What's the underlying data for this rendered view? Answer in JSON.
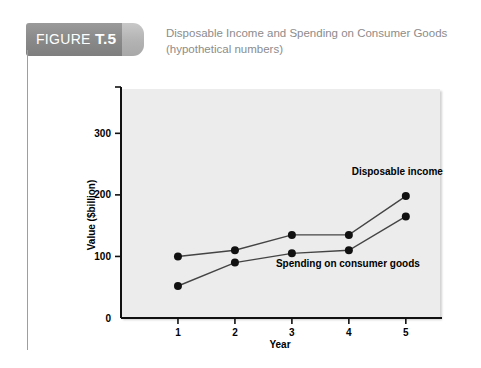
{
  "figure": {
    "label_prefix": "FIGURE ",
    "label_number": "T.5",
    "caption_line1": "Disposable Income and Spending on Consumer Goods",
    "caption_line2": "(hypothetical numbers)",
    "banner_color": "#8b8b8b",
    "caption_color": "#8c8c8c"
  },
  "chart_data": {
    "type": "line",
    "title": "Disposable Income and Spending on Consumer Goods (hypothetical numbers)",
    "xlabel": "Year",
    "ylabel": "Value ($billion)",
    "categories": [
      "1",
      "2",
      "3",
      "4",
      "5"
    ],
    "x": [
      1,
      2,
      3,
      4,
      5
    ],
    "xlim": [
      0,
      5.6
    ],
    "ylim": [
      0,
      372
    ],
    "xticks": [
      "1",
      "2",
      "3",
      "4",
      "5"
    ],
    "yticks": [
      "0",
      "100",
      "200",
      "300"
    ],
    "ytick_values": [
      0,
      100,
      200,
      300
    ],
    "grid": false,
    "legend": "inline-annotations",
    "plot_background": "#ececec",
    "series": [
      {
        "name": "Disposable income",
        "values": [
          100,
          110,
          135,
          135,
          198
        ],
        "color": "#444444",
        "marker_color": "#111111",
        "label_x": 4.05,
        "label_y": 232
      },
      {
        "name": "Spending on consumer goods",
        "values": [
          52,
          90,
          105,
          110,
          165
        ],
        "color": "#444444",
        "marker_color": "#111111",
        "label_x": 2.72,
        "label_y": 83
      }
    ]
  }
}
